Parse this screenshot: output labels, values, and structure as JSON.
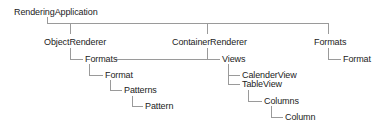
{
  "diagram": {
    "type": "tree",
    "root": "RenderingApplication",
    "nodes": [
      {
        "id": "n0",
        "label": "RenderingApplication",
        "parent": null,
        "x": 14,
        "y": 7
      },
      {
        "id": "n1",
        "label": "ObjectRenderer",
        "parent": "n0",
        "x": 44,
        "y": 37
      },
      {
        "id": "n2",
        "label": "ContainerRenderer",
        "parent": "n0",
        "x": 172,
        "y": 37
      },
      {
        "id": "n3",
        "label": "Formats",
        "parent": "n0",
        "x": 314,
        "y": 37
      },
      {
        "id": "n4",
        "label": "Formats",
        "parent": "n1",
        "x": 85,
        "y": 54
      },
      {
        "id": "n5",
        "label": "Format",
        "parent": "n4",
        "x": 105,
        "y": 70
      },
      {
        "id": "n6",
        "label": "Patterns",
        "parent": "n5",
        "x": 124,
        "y": 85
      },
      {
        "id": "n7",
        "label": "Pattern",
        "parent": "n6",
        "x": 145,
        "y": 101
      },
      {
        "id": "n8",
        "label": "Views",
        "parent": "n2",
        "x": 222,
        "y": 54
      },
      {
        "id": "n9",
        "label": "CalenderView",
        "parent": "n8",
        "x": 242,
        "y": 70
      },
      {
        "id": "n10",
        "label": "TableView",
        "parent": "n8",
        "x": 242,
        "y": 79
      },
      {
        "id": "n11",
        "label": "Columns",
        "parent": "n10",
        "x": 264,
        "y": 96
      },
      {
        "id": "n12",
        "label": "Column",
        "parent": "n11",
        "x": 285,
        "y": 112
      },
      {
        "id": "n13",
        "label": "Format",
        "parent": "n3",
        "x": 343,
        "y": 54
      }
    ],
    "edges": [
      {
        "from": "n0",
        "to": "n1"
      },
      {
        "from": "n0",
        "to": "n2"
      },
      {
        "from": "n0",
        "to": "n3"
      },
      {
        "from": "n1",
        "to": "n4"
      },
      {
        "from": "n4",
        "to": "n5"
      },
      {
        "from": "n5",
        "to": "n6"
      },
      {
        "from": "n6",
        "to": "n7"
      },
      {
        "from": "n2",
        "to": "n8"
      },
      {
        "from": "n4",
        "to": "n8"
      },
      {
        "from": "n8",
        "to": "n9"
      },
      {
        "from": "n8",
        "to": "n10"
      },
      {
        "from": "n10",
        "to": "n11"
      },
      {
        "from": "n11",
        "to": "n12"
      },
      {
        "from": "n3",
        "to": "n13"
      }
    ],
    "colors": {
      "text": "#222222",
      "connector": "#9a9a9a",
      "background": "#ffffff"
    }
  }
}
